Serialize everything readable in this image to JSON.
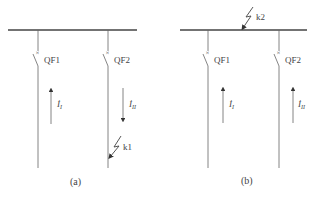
{
  "diagram": {
    "type": "single-line fault diagram",
    "colors": {
      "line": "#555555",
      "text": "#444444",
      "background": "#ffffff"
    },
    "panels": [
      {
        "id": "a",
        "caption": "(a)",
        "bus": {
          "label": ""
        },
        "feeders": [
          {
            "breaker": "QF1",
            "current_label": "İ",
            "current_sub": "I",
            "current_direction": "up"
          },
          {
            "breaker": "QF2",
            "current_label": "İ",
            "current_sub": "II",
            "current_direction": "down"
          }
        ],
        "fault": {
          "label": "k1",
          "location": "feeder QF2"
        }
      },
      {
        "id": "b",
        "caption": "(b)",
        "bus": {
          "label": ""
        },
        "feeders": [
          {
            "breaker": "QF1",
            "current_label": "İ",
            "current_sub": "I",
            "current_direction": "up"
          },
          {
            "breaker": "QF2",
            "current_label": "İ",
            "current_sub": "II",
            "current_direction": "up"
          }
        ],
        "fault": {
          "label": "k2",
          "location": "busbar"
        }
      }
    ]
  }
}
